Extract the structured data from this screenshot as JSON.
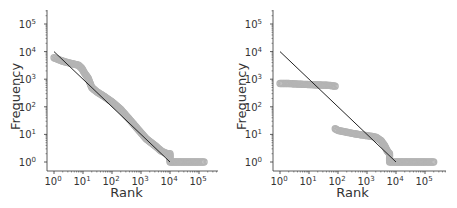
{
  "chart_data": [
    {
      "type": "scatter",
      "title": "",
      "xlabel": "Rank",
      "ylabel": "Frequency",
      "xscale": "log",
      "yscale": "log",
      "xlim": [
        0.7,
        200000
      ],
      "ylim": [
        0.6,
        300000
      ],
      "xticks": [
        "10^0",
        "10^1",
        "10^2",
        "10^3",
        "10^4",
        "10^5"
      ],
      "yticks": [
        "10^0",
        "10^1",
        "10^2",
        "10^3",
        "10^4",
        "10^5"
      ],
      "grid": false,
      "series": [
        {
          "name": "observed",
          "style": "hollow-grey-circles",
          "points": [
            [
              1,
              6000
            ],
            [
              2,
              4500
            ],
            [
              3,
              4000
            ],
            [
              5,
              3500
            ],
            [
              7,
              3200
            ],
            [
              9,
              2500
            ],
            [
              12,
              1500
            ],
            [
              15,
              1100
            ],
            [
              20,
              500
            ],
            [
              30,
              350
            ],
            [
              50,
              250
            ],
            [
              100,
              150
            ],
            [
              200,
              80
            ],
            [
              400,
              35
            ],
            [
              800,
              15
            ],
            [
              1500,
              7
            ],
            [
              3000,
              4
            ],
            [
              5000,
              2.5
            ],
            [
              8000,
              2
            ],
            [
              10000,
              2
            ],
            [
              10000,
              1
            ],
            [
              30000,
              1
            ],
            [
              100000,
              1
            ],
            [
              150000,
              1
            ]
          ]
        },
        {
          "name": "fit",
          "style": "black-line",
          "points": [
            [
              1,
              10000
            ],
            [
              10000,
              1
            ]
          ]
        }
      ]
    },
    {
      "type": "scatter",
      "title": "",
      "xlabel": "Rank",
      "ylabel": "Frequency",
      "xscale": "log",
      "yscale": "log",
      "xlim": [
        0.7,
        200000
      ],
      "ylim": [
        0.6,
        300000
      ],
      "xticks": [
        "10^0",
        "10^1",
        "10^2",
        "10^3",
        "10^4",
        "10^5"
      ],
      "yticks": [
        "10^0",
        "10^1",
        "10^2",
        "10^3",
        "10^4",
        "10^5"
      ],
      "grid": false,
      "series": [
        {
          "name": "observed",
          "style": "hollow-grey-circles",
          "points": [
            [
              1,
              700
            ],
            [
              2,
              700
            ],
            [
              3,
              680
            ],
            [
              5,
              660
            ],
            [
              10,
              640
            ],
            [
              20,
              620
            ],
            [
              50,
              600
            ],
            [
              80,
              560
            ],
            [
              80,
              16
            ],
            [
              100,
              14
            ],
            [
              200,
              12
            ],
            [
              500,
              10
            ],
            [
              1000,
              9
            ],
            [
              2000,
              8
            ],
            [
              3000,
              6
            ],
            [
              4000,
              4
            ],
            [
              5000,
              2.5
            ],
            [
              6000,
              2
            ],
            [
              6000,
              1
            ],
            [
              10000,
              1
            ],
            [
              30000,
              1
            ],
            [
              100000,
              1
            ],
            [
              200000,
              1
            ]
          ]
        },
        {
          "name": "fit",
          "style": "black-line",
          "points": [
            [
              1,
              10000
            ],
            [
              10000,
              1
            ]
          ]
        }
      ]
    }
  ],
  "labels": {
    "xlabel": "Rank",
    "ylabel": "Frequency",
    "tick_base": "10",
    "tick_exps": [
      "0",
      "1",
      "2",
      "3",
      "4",
      "5"
    ]
  },
  "colors": {
    "points": "#b4b4b4",
    "fit_line": "#222222",
    "axis": "#333333"
  }
}
